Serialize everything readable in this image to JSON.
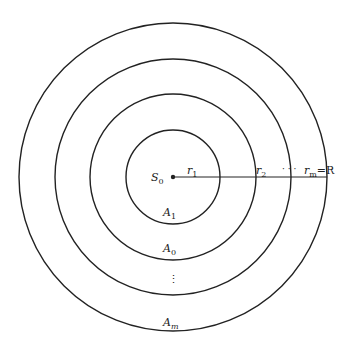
{
  "diagram": {
    "center": {
      "label": "S",
      "sub": "0"
    },
    "radii_labels": [
      {
        "label": "r",
        "sub": "1"
      },
      {
        "label": "r",
        "sub": "2"
      },
      {
        "label": "· · ·",
        "sub": ""
      },
      {
        "label": "r",
        "sub": "m",
        "suffix": "=R"
      }
    ],
    "regions": [
      {
        "label": "A",
        "sub": "1"
      },
      {
        "label": "A",
        "sub": "0"
      },
      {
        "label": "⋮",
        "sub": ""
      },
      {
        "label": "A",
        "sub": "m"
      }
    ],
    "colors": {
      "stroke": "#222222",
      "background": "#ffffff"
    }
  }
}
